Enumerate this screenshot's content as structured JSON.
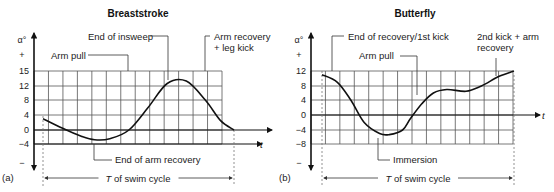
{
  "chart_data": [
    {
      "type": "line",
      "panel_label": "(a)",
      "title": "Breaststroke",
      "ylabel": "α°",
      "xlabel": "t",
      "y_plus_label": "+",
      "y_minus_label": "−",
      "yticks": [
        15,
        12,
        8,
        4,
        0,
        -4
      ],
      "ylim": [
        -4,
        15
      ],
      "grid": true,
      "x_fraction_of_cycle": [
        0,
        0.1,
        0.2,
        0.27,
        0.35,
        0.45,
        0.55,
        0.65,
        0.75,
        0.85,
        0.93,
        1.0
      ],
      "values": [
        3,
        0.5,
        -1.8,
        -2.8,
        -2.5,
        0,
        6,
        12.5,
        13,
        8,
        2.5,
        0
      ],
      "annotations": {
        "top": [
          "Arm pull",
          "End of insweep",
          "Arm recovery\n+ leg kick"
        ],
        "bottom": [
          "End of arm recovery"
        ]
      },
      "cycle_label_italic": "T",
      "cycle_label": " of swim cycle"
    },
    {
      "type": "line",
      "panel_label": "(b)",
      "title": "Butterfly",
      "ylabel": "α°",
      "xlabel": "t",
      "y_plus_label": "+",
      "y_minus_label": "−",
      "yticks": [
        12,
        8,
        4,
        0,
        -4,
        -8
      ],
      "ylim": [
        -8,
        12
      ],
      "grid": true,
      "x_fraction_of_cycle": [
        0,
        0.08,
        0.15,
        0.22,
        0.3,
        0.35,
        0.42,
        0.46,
        0.52,
        0.58,
        0.65,
        0.75,
        0.83,
        0.92,
        1.0
      ],
      "values": [
        11,
        9,
        4,
        -2,
        -5,
        -5.3,
        -4,
        -1,
        3,
        6,
        7,
        6.5,
        8,
        10.5,
        12
      ],
      "annotations": {
        "top": [
          "End of recovery/1st kick",
          "Arm pull",
          "2nd kick + arm\nrecovery"
        ],
        "bottom": [
          "Immersion"
        ]
      },
      "cycle_label_italic": "T",
      "cycle_label": " of swim cycle"
    }
  ]
}
